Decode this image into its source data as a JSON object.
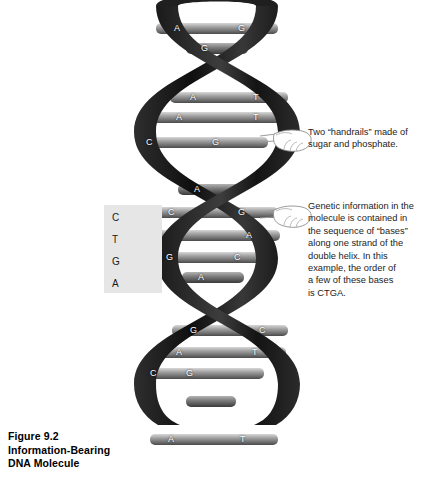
{
  "figure": {
    "caption": "Figure 9.2\nInformation-Bearing\nDNA Molecule"
  },
  "callout_panel": {
    "letters": [
      "C",
      "T",
      "G",
      "A"
    ],
    "background_color": "#e6e6e6"
  },
  "annotations": [
    {
      "id": "handrails",
      "text": "Two “handrails” made of\nsugar and phosphate."
    },
    {
      "id": "bases",
      "text": "Genetic information in the\nmolecule is contained in\nthe sequence of “bases”\nalong one strand of the\ndouble helix. In this\nexample, the order of\na few of these bases\nis CTGA."
    }
  ],
  "dna": {
    "strand_color": "#262626",
    "rung_color": "#9a9a9a",
    "letter_color": "#ffffff",
    "base_pairs": [
      {
        "left": "A",
        "right": "G",
        "y": 28,
        "x1": 28,
        "x2": 150
      },
      {
        "left": "G",
        "right": "",
        "y": 48,
        "x1": 58,
        "x2": 120
      },
      {
        "left": "A",
        "right": "T",
        "y": 97,
        "x1": 42,
        "x2": 160
      },
      {
        "left": "A",
        "right": "T",
        "y": 117,
        "x1": 22,
        "x2": 160
      },
      {
        "left": "C",
        "right": "G",
        "y": 142,
        "x1": 8,
        "x2": 140
      },
      {
        "left": "A",
        "right": "",
        "y": 189,
        "x1": 50,
        "x2": 112
      },
      {
        "left": "C",
        "right": "G",
        "y": 212,
        "x1": 22,
        "x2": 150
      },
      {
        "left": "T",
        "right": "A",
        "y": 235,
        "x1": 8,
        "x2": 152
      },
      {
        "left": "G",
        "right": "C",
        "y": 257,
        "x1": 20,
        "x2": 148
      },
      {
        "left": "A",
        "right": "",
        "y": 277,
        "x1": 54,
        "x2": 116
      },
      {
        "left": "G",
        "right": "C",
        "y": 330,
        "x1": 44,
        "x2": 160
      },
      {
        "left": "A",
        "right": "T",
        "y": 352,
        "x1": 28,
        "x2": 158
      },
      {
        "left": "C",
        "right": "G",
        "y": 373,
        "x1": 10,
        "x2": 136
      },
      {
        "left": "A",
        "right": "T",
        "y": 440,
        "x1": 30,
        "x2": 146
      }
    ]
  }
}
